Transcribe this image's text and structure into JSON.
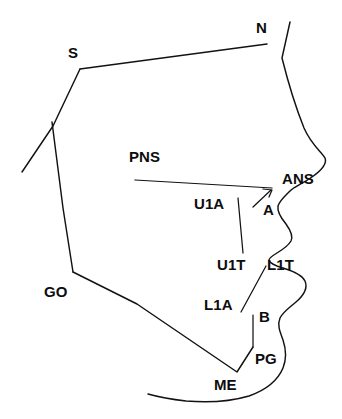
{
  "figure": {
    "name": "cephalometric-tracing",
    "background_color": "#ffffff",
    "line_color": "#121212",
    "width": 342,
    "height": 419
  },
  "landmarks": [
    {
      "id": "S",
      "label": "S",
      "name": "sella",
      "x": 68,
      "y": 45
    },
    {
      "id": "N",
      "label": "N",
      "name": "nasion",
      "x": 256,
      "y": 20
    },
    {
      "id": "PNS",
      "label": "PNS",
      "name": "posterior-nasal-spine",
      "x": 129,
      "y": 149
    },
    {
      "id": "ANS",
      "label": "ANS",
      "name": "anterior-nasal-spine",
      "x": 282,
      "y": 171
    },
    {
      "id": "U1A",
      "label": "U1A",
      "name": "upper-incisor-apex",
      "x": 194,
      "y": 196
    },
    {
      "id": "A",
      "label": "A",
      "name": "a-point",
      "x": 263,
      "y": 202
    },
    {
      "id": "U1T",
      "label": "U1T",
      "name": "upper-incisor-tip",
      "x": 217,
      "y": 257
    },
    {
      "id": "L1T",
      "label": "L1T",
      "name": "lower-incisor-tip",
      "x": 267,
      "y": 257
    },
    {
      "id": "GO",
      "label": "GO",
      "name": "gonion",
      "x": 44,
      "y": 284
    },
    {
      "id": "L1A",
      "label": "L1A",
      "name": "lower-incisor-apex",
      "x": 204,
      "y": 297
    },
    {
      "id": "B",
      "label": "B",
      "name": "b-point",
      "x": 259,
      "y": 309
    },
    {
      "id": "PG",
      "label": "PG",
      "name": "pogonion",
      "x": 255,
      "y": 351
    },
    {
      "id": "ME",
      "label": "ME",
      "name": "menton",
      "x": 214,
      "y": 377
    }
  ],
  "outlines": [
    {
      "id": "soft-tissue-profile",
      "name": "soft-tissue-facial-profile",
      "d": "M 290,22 L 286,40 L 282,58 C 288,82 296,108 304,128 C 312,146 322,152 325,158 C 327,163 322,170 312,177 C 302,184 294,187 290,191 C 285,196 280,200 278,206 C 277,212 281,218 286,224 C 291,231 293,237 291,241 C 288,246 282,250 277,253 C 272,256 269,258 269,260 C 270,264 276,266 283,268 C 293,271 302,275 305,281 C 308,288 303,296 296,302 C 289,308 283,312 280,318 C 277,325 280,332 283,340 C 286,349 287,358 283,368 C 278,380 266,390 249,396 C 232,401 210,403 186,401 C 168,399 155,396 148,394"
    },
    {
      "id": "cranial-base-sn",
      "name": "sella-nasion-line-and-cranial-base",
      "d": "M 267,44 L 80,69"
    },
    {
      "id": "sella-posterior-limb",
      "name": "sella-to-articulare-limb",
      "d": "M 80,69 L 53,126 L 22,172"
    },
    {
      "id": "mandibular-ramus",
      "name": "ramus-posterior-border",
      "d": "M 52,122 L 63,208 L 73,272"
    },
    {
      "id": "mandibular-body",
      "name": "mandibular-lower-border",
      "d": "M 73,272 L 137,304 L 237,372 L 253,347"
    },
    {
      "id": "symphysis-anterior",
      "name": "symphysis-anterior-border",
      "d": "M 253,315 L 253,347"
    },
    {
      "id": "palatal-plane",
      "name": "palatal-plane-pns-to-ans",
      "d": "M 135,180 L 272,188"
    },
    {
      "id": "a-point-marker",
      "name": "a-point-indicator",
      "d": "M 253,207 L 271,190"
    },
    {
      "id": "a-point-tick",
      "name": "a-point-tick-mark",
      "d": "M 263,189 L 272,190 L 269,197"
    },
    {
      "id": "upper-incisor-axis",
      "name": "upper-incisor-long-axis",
      "d": "M 238,198 L 243,253"
    },
    {
      "id": "lower-incisor-axis",
      "name": "lower-incisor-long-axis",
      "d": "M 266,266 L 241,312"
    }
  ]
}
